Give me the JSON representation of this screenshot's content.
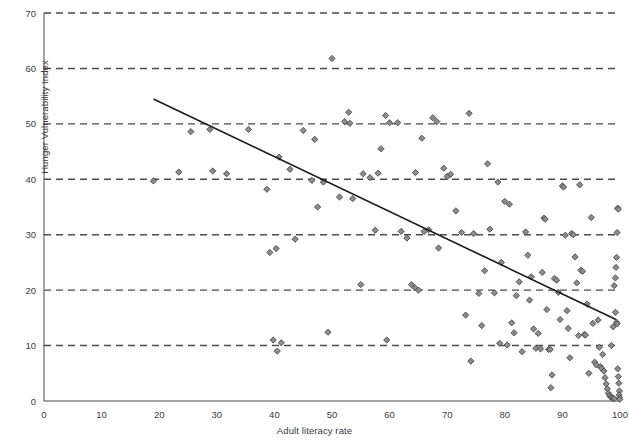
{
  "chart_data": {
    "type": "scatter",
    "title": "",
    "xlabel": "Adult literacy rate",
    "ylabel": "Hunger Vulnerability Index",
    "xlim": [
      0,
      100
    ],
    "ylim": [
      0,
      70
    ],
    "xticks": [
      0,
      10,
      20,
      30,
      40,
      50,
      60,
      70,
      80,
      90,
      100
    ],
    "yticks": [
      0,
      10,
      20,
      30,
      40,
      50,
      60,
      70
    ],
    "grid": "horizontal-dashed",
    "legend": "none",
    "marker": "diamond",
    "marker_fill": "#8c8c8c",
    "marker_stroke": "#4a4a4a",
    "trendline": {
      "type": "linear",
      "color": "#1a1a1a",
      "x_start": 19.0,
      "y_start": 54.5,
      "x_end": 99.3,
      "y_end": 14.7
    },
    "points": [
      [
        19.0,
        39.7
      ],
      [
        23.4,
        41.3
      ],
      [
        25.5,
        48.6
      ],
      [
        28.8,
        49.0
      ],
      [
        29.3,
        41.5
      ],
      [
        31.7,
        41.0
      ],
      [
        35.5,
        49.0
      ],
      [
        38.7,
        38.2
      ],
      [
        39.2,
        26.8
      ],
      [
        40.3,
        27.5
      ],
      [
        40.8,
        44.0
      ],
      [
        42.7,
        41.8
      ],
      [
        43.6,
        29.2
      ],
      [
        45.0,
        48.8
      ],
      [
        46.5,
        39.8
      ],
      [
        47.0,
        47.2
      ],
      [
        47.5,
        35.0
      ],
      [
        48.5,
        39.5
      ],
      [
        49.3,
        12.4
      ],
      [
        50.0,
        61.8
      ],
      [
        51.3,
        36.8
      ],
      [
        52.2,
        50.4
      ],
      [
        52.9,
        52.1
      ],
      [
        53.1,
        50.1
      ],
      [
        53.6,
        36.5
      ],
      [
        55.4,
        41.0
      ],
      [
        56.6,
        40.3
      ],
      [
        57.5,
        30.8
      ],
      [
        58.0,
        41.1
      ],
      [
        58.5,
        45.5
      ],
      [
        59.3,
        51.5
      ],
      [
        60.0,
        50.2
      ],
      [
        61.4,
        50.2
      ],
      [
        62.0,
        30.6
      ],
      [
        63.0,
        29.4
      ],
      [
        64.5,
        41.2
      ],
      [
        65.6,
        47.4
      ],
      [
        66.0,
        30.6
      ],
      [
        66.8,
        30.9
      ],
      [
        67.5,
        51.1
      ],
      [
        68.2,
        50.4
      ],
      [
        68.5,
        27.6
      ],
      [
        69.4,
        42.0
      ],
      [
        70.0,
        40.5
      ],
      [
        70.6,
        40.9
      ],
      [
        71.5,
        34.3
      ],
      [
        72.5,
        30.4
      ],
      [
        73.2,
        15.5
      ],
      [
        73.8,
        51.9
      ],
      [
        74.1,
        7.2
      ],
      [
        74.6,
        30.2
      ],
      [
        75.5,
        19.4
      ],
      [
        76.0,
        13.6
      ],
      [
        76.5,
        23.5
      ],
      [
        77.0,
        42.8
      ],
      [
        77.4,
        31.0
      ],
      [
        78.2,
        19.5
      ],
      [
        78.8,
        39.5
      ],
      [
        79.1,
        10.4
      ],
      [
        79.4,
        25.0
      ],
      [
        80.0,
        36.0
      ],
      [
        80.4,
        10.1
      ],
      [
        80.8,
        35.5
      ],
      [
        81.2,
        14.1
      ],
      [
        81.6,
        12.3
      ],
      [
        82.0,
        19.0
      ],
      [
        82.5,
        21.5
      ],
      [
        83.0,
        8.9
      ],
      [
        83.6,
        30.5
      ],
      [
        84.0,
        26.3
      ],
      [
        84.3,
        18.2
      ],
      [
        84.6,
        22.4
      ],
      [
        85.0,
        13.0
      ],
      [
        85.4,
        9.5
      ],
      [
        85.8,
        12.2
      ],
      [
        86.2,
        9.4
      ],
      [
        86.5,
        23.2
      ],
      [
        86.8,
        33.0
      ],
      [
        87.0,
        32.8
      ],
      [
        87.3,
        16.5
      ],
      [
        87.6,
        9.3
      ],
      [
        87.9,
        9.3
      ],
      [
        88.2,
        4.7
      ],
      [
        88.6,
        22.1
      ],
      [
        89.0,
        21.8
      ],
      [
        89.3,
        19.6
      ],
      [
        89.6,
        14.7
      ],
      [
        90.0,
        38.8
      ],
      [
        90.2,
        38.6
      ],
      [
        90.5,
        29.9
      ],
      [
        90.8,
        16.3
      ],
      [
        91.0,
        13.1
      ],
      [
        91.3,
        7.8
      ],
      [
        91.6,
        30.2
      ],
      [
        91.9,
        30.0
      ],
      [
        92.2,
        26.0
      ],
      [
        92.5,
        21.3
      ],
      [
        92.8,
        11.8
      ],
      [
        93.0,
        39.0
      ],
      [
        93.2,
        23.6
      ],
      [
        93.5,
        23.4
      ],
      [
        93.8,
        12.0
      ],
      [
        94.0,
        11.9
      ],
      [
        94.3,
        17.5
      ],
      [
        94.6,
        5.0
      ],
      [
        95.0,
        33.1
      ],
      [
        95.3,
        14.0
      ],
      [
        95.6,
        7.0
      ],
      [
        95.9,
        6.5
      ],
      [
        96.2,
        14.6
      ],
      [
        96.4,
        9.7
      ],
      [
        96.6,
        6.2
      ],
      [
        96.8,
        5.9
      ],
      [
        97.0,
        8.4
      ],
      [
        97.2,
        5.4
      ],
      [
        97.4,
        4.2
      ],
      [
        97.6,
        3.1
      ],
      [
        97.8,
        2.2
      ],
      [
        98.0,
        1.4
      ],
      [
        98.2,
        1.0
      ],
      [
        98.4,
        0.7
      ],
      [
        98.6,
        0.6
      ],
      [
        98.8,
        0.5
      ],
      [
        99.0,
        0.4
      ],
      [
        98.5,
        10.0
      ],
      [
        98.8,
        13.4
      ],
      [
        99.0,
        20.8
      ],
      [
        99.2,
        22.2
      ],
      [
        99.3,
        24.1
      ],
      [
        99.4,
        25.9
      ],
      [
        99.5,
        30.4
      ],
      [
        99.6,
        34.8
      ],
      [
        99.7,
        34.6
      ],
      [
        99.2,
        16.0
      ],
      [
        99.4,
        14.2
      ],
      [
        99.5,
        13.9
      ],
      [
        99.6,
        5.8
      ],
      [
        99.7,
        4.4
      ],
      [
        99.8,
        3.2
      ],
      [
        99.9,
        1.8
      ],
      [
        99.85,
        1.1
      ],
      [
        99.9,
        0.6
      ],
      [
        99.95,
        0.3
      ],
      [
        63.8,
        21.0
      ],
      [
        64.4,
        20.4
      ],
      [
        65.0,
        20.0
      ],
      [
        55.0,
        21.0
      ],
      [
        88.0,
        2.4
      ],
      [
        59.5,
        11.0
      ],
      [
        39.8,
        11.0
      ],
      [
        41.2,
        10.5
      ],
      [
        40.5,
        9.0
      ]
    ]
  }
}
